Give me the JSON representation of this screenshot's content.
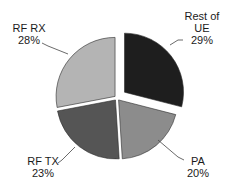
{
  "chart_data": {
    "type": "pie",
    "title": "",
    "exploded": [
      "Rest of UE"
    ],
    "slices": [
      {
        "label": "Rest of UE",
        "value": 29,
        "display": "29%",
        "color": "#1e1e1e"
      },
      {
        "label": "PA",
        "value": 20,
        "display": "20%",
        "color": "#8c8c8c"
      },
      {
        "label": "RF TX",
        "value": 23,
        "display": "23%",
        "color": "#555555"
      },
      {
        "label": "RF RX",
        "value": 28,
        "display": "28%",
        "color": "#b4b4b4"
      }
    ]
  },
  "labels": {
    "rest_of_ue_line1": "Rest of",
    "rest_of_ue_line2": "UE",
    "rest_of_ue_pct": "29%",
    "pa_name": "PA",
    "pa_pct": "20%",
    "rf_tx_name": "RF TX",
    "rf_tx_pct": "23%",
    "rf_rx_name": "RF RX",
    "rf_rx_pct": "28%"
  }
}
